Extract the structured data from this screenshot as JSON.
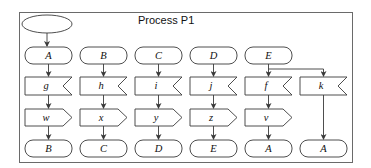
{
  "diagram": {
    "title": "Process P1",
    "start_symbol": "start-ellipse",
    "columns": [
      {
        "id": "col-1",
        "entry": "A",
        "receive": "g",
        "send": "w",
        "exit": "B"
      },
      {
        "id": "col-2",
        "entry": "B",
        "receive": "h",
        "send": "x",
        "exit": "C"
      },
      {
        "id": "col-3",
        "entry": "C",
        "receive": "i",
        "send": "y",
        "exit": "D"
      },
      {
        "id": "col-4",
        "entry": "D",
        "receive": "j",
        "send": "z",
        "exit": "E"
      },
      {
        "id": "col-5",
        "entry": "E",
        "receive": "f",
        "send": "v",
        "exit": "A"
      },
      {
        "id": "col-6",
        "entry": null,
        "receive": "k",
        "send": null,
        "exit": "A"
      }
    ],
    "edges": [
      [
        "start",
        "A"
      ],
      [
        "A",
        "g"
      ],
      [
        "g",
        "w"
      ],
      [
        "w",
        "B"
      ],
      [
        "B",
        "h"
      ],
      [
        "h",
        "x"
      ],
      [
        "x",
        "C"
      ],
      [
        "C",
        "i"
      ],
      [
        "i",
        "y"
      ],
      [
        "y",
        "D"
      ],
      [
        "D",
        "j"
      ],
      [
        "j",
        "z"
      ],
      [
        "z",
        "E"
      ],
      [
        "E",
        "f"
      ],
      [
        "f",
        "v"
      ],
      [
        "v",
        "A"
      ],
      [
        "E",
        "k"
      ],
      [
        "k",
        "A"
      ]
    ],
    "colors": {
      "stroke": "#3a3a3a",
      "frame": "#6a6a6a",
      "background": "#ffffff"
    }
  }
}
